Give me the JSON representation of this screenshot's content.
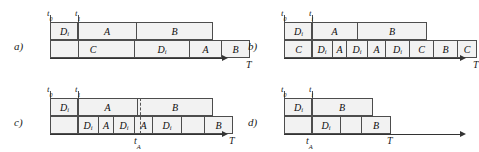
{
  "figure": {
    "type": "gantt-schedule-diagram",
    "colors": {
      "cell_fill": "#f2f2f2",
      "cell_border": "#4d4d4d",
      "axis": "#333333",
      "text": "#0d0d0d",
      "background": "#ffffff"
    }
  },
  "panels": [
    {
      "id": "a",
      "label": "a)",
      "ticks": [
        {
          "name": "t0",
          "text": "t",
          "sub": "0"
        },
        {
          "name": "t1",
          "text": "t",
          "sub": "1"
        }
      ],
      "axis_label": {
        "text": "T",
        "sub": ""
      },
      "rows": [
        {
          "name": "top-row",
          "cells": [
            {
              "text": "D",
              "sub": "i",
              "width": 29
            },
            {
              "text": "A",
              "sub": "",
              "width": 60
            },
            {
              "text": "B",
              "sub": "",
              "width": 77
            }
          ]
        },
        {
          "name": "bottom-row",
          "cells": [
            {
              "text": "C",
              "sub": "",
              "width": 86
            },
            {
              "text": "D",
              "sub": "i",
              "width": 56
            },
            {
              "text": "A",
              "sub": "",
              "width": 33
            },
            {
              "text": "B",
              "sub": "",
              "width": 29
            }
          ]
        }
      ]
    },
    {
      "id": "b",
      "label": "b)",
      "ticks": [
        {
          "name": "t0",
          "text": "t",
          "sub": "0"
        },
        {
          "name": "t1",
          "text": "t",
          "sub": "i"
        }
      ],
      "axis_label": {
        "text": "T",
        "sub": ""
      },
      "rows": [
        {
          "name": "top-row",
          "cells": [
            {
              "text": "D",
              "sub": "i",
              "width": 29
            },
            {
              "text": "A",
              "sub": "",
              "width": 47
            },
            {
              "text": "B",
              "sub": "",
              "width": 70
            }
          ]
        },
        {
          "name": "bottom-row",
          "cells": [
            {
              "text": "C",
              "sub": "",
              "width": 29
            },
            {
              "text": "D",
              "sub": "i",
              "width": 22
            },
            {
              "text": "A",
              "sub": "",
              "width": 15
            },
            {
              "text": "D",
              "sub": "i",
              "width": 22
            },
            {
              "text": "A",
              "sub": "",
              "width": 19
            },
            {
              "text": "D",
              "sub": "i",
              "width": 25
            },
            {
              "text": "C",
              "sub": "",
              "width": 25
            },
            {
              "text": "B",
              "sub": "",
              "width": 25
            },
            {
              "text": "C",
              "sub": "",
              "width": 20
            }
          ]
        }
      ]
    },
    {
      "id": "c",
      "label": "c)",
      "ticks": [
        {
          "name": "t0",
          "text": "t",
          "sub": "0"
        },
        {
          "name": "t1",
          "text": "t",
          "sub": "1"
        }
      ],
      "axis_label": {
        "text": "T",
        "sub": ""
      },
      "marker": {
        "name": "tA",
        "text": "t",
        "sub": "A"
      },
      "rows": [
        {
          "name": "top-row",
          "cells": [
            {
              "text": "D",
              "sub": "i",
              "width": 29
            },
            {
              "text": "A",
              "sub": "",
              "width": 61
            },
            {
              "text": "B",
              "sub": "",
              "width": 76
            }
          ]
        },
        {
          "name": "bottom-row",
          "cells": [
            {
              "text": "",
              "sub": "",
              "width": 29
            },
            {
              "text": "D",
              "sub": "i",
              "width": 22
            },
            {
              "text": "A",
              "sub": "",
              "width": 16
            },
            {
              "text": "D",
              "sub": "i",
              "width": 22
            },
            {
              "text": "A",
              "sub": "",
              "width": 19
            },
            {
              "text": "D",
              "sub": "i",
              "width": 30
            },
            {
              "text": "",
              "sub": "",
              "width": 24
            },
            {
              "text": "B",
              "sub": "",
              "width": 29
            }
          ]
        }
      ]
    },
    {
      "id": "d",
      "label": "d)",
      "ticks": [
        {
          "name": "t0",
          "text": "t",
          "sub": "0"
        },
        {
          "name": "t1",
          "text": "t",
          "sub": "i"
        }
      ],
      "axis_label": {
        "text": "T",
        "sub": ""
      },
      "marker": {
        "name": "tA",
        "text": "t",
        "sub": "A"
      },
      "rows": [
        {
          "name": "top-row",
          "cells": [
            {
              "text": "D",
              "sub": "i",
              "width": 29
            },
            {
              "text": "B",
              "sub": "",
              "width": 62
            }
          ]
        },
        {
          "name": "bottom-row",
          "cells": [
            {
              "text": "",
              "sub": "",
              "width": 29
            },
            {
              "text": "D",
              "sub": "i",
              "width": 30
            },
            {
              "text": "",
              "sub": "",
              "width": 22
            },
            {
              "text": "B",
              "sub": "",
              "width": 30
            }
          ]
        }
      ]
    }
  ]
}
